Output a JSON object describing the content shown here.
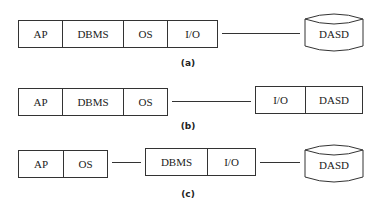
{
  "diagrams": [
    {
      "id": "a",
      "caption": "(a)",
      "groups": [
        {
          "cells": [
            "AP",
            "DBMS",
            "OS",
            "I/O"
          ]
        }
      ],
      "storage": "DASD"
    },
    {
      "id": "b",
      "caption": "(b)",
      "groups": [
        {
          "cells": [
            "AP",
            "DBMS",
            "OS"
          ]
        },
        {
          "cells": [
            "I/O",
            "DASD"
          ]
        }
      ]
    },
    {
      "id": "c",
      "caption": "(c)",
      "groups": [
        {
          "cells": [
            "AP",
            "OS"
          ]
        },
        {
          "cells": [
            "DBMS",
            "I/O"
          ]
        }
      ],
      "storage": "DASD"
    }
  ]
}
